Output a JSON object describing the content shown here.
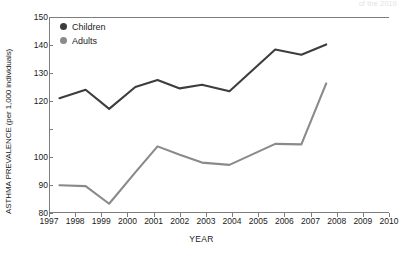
{
  "watermark": {
    "text": "of the 2010"
  },
  "chart_data": {
    "type": "line",
    "title": "",
    "xlabel": "YEAR",
    "ylabel": "ASTHMA PREVALENCE (per 1,000 individuals)",
    "xlim": [
      1997,
      2010
    ],
    "ylim": [
      80,
      150
    ],
    "grid": false,
    "legend_position": "top-left",
    "x_tick_labels": [
      "1997",
      "1998",
      "1999",
      "2000",
      "2001",
      "2002",
      "2003",
      "2004",
      "2005",
      "2006",
      "2007",
      "2008",
      "2009",
      "2010"
    ],
    "y_tick_labels": [
      "150",
      "140",
      "130",
      "120",
      "",
      "100",
      "90",
      "80"
    ],
    "y_tick_values": [
      150,
      140,
      130,
      120,
      110,
      100,
      90,
      80
    ],
    "x": [
      1997.4,
      1998.4,
      1999.3,
      2000.3,
      2001.15,
      2002.0,
      2002.85,
      2003.9,
      2005.65,
      2006.65,
      2007.6
    ],
    "series": [
      {
        "name": "Children",
        "color": "#3d3d3d",
        "values": [
          121.0,
          124.0,
          117.2,
          125.0,
          127.5,
          124.5,
          125.8,
          123.5,
          138.4,
          136.5,
          140.2
        ]
      },
      {
        "name": "Adults",
        "color": "#8a8a8a",
        "values": [
          89.9,
          89.6,
          83.3,
          94.5,
          103.8,
          100.8,
          98.0,
          97.2,
          104.7,
          104.5,
          126.3
        ]
      }
    ]
  },
  "legend": {
    "items": [
      {
        "label": "Children",
        "color": "#3d3d3d"
      },
      {
        "label": "Adults",
        "color": "#8a8a8a"
      }
    ]
  }
}
